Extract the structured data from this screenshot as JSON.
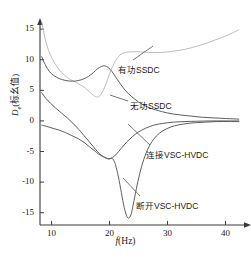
{
  "chart_data": {
    "type": "line",
    "title": "",
    "xlabel": "f(Hz)",
    "ylabel": "De(标幺值)",
    "ylabel_base": "D",
    "ylabel_sub": "e",
    "ylabel_unit": "(标幺值)",
    "xlim": [
      8,
      42.5
    ],
    "ylim": [
      -17.5,
      16.5
    ],
    "xticks": [
      10,
      20,
      30,
      40
    ],
    "yticks": [
      15,
      10,
      5,
      0,
      -5,
      -10,
      -15
    ],
    "grid": false,
    "legend_position": "inline-annotations",
    "series": [
      {
        "name": "有功SSDC",
        "color": "#b8b8b8",
        "points": [
          [
            8.3,
            16.2
          ],
          [
            8.7,
            14.2
          ],
          [
            9.2,
            12.3
          ],
          [
            9.8,
            10.8
          ],
          [
            10.5,
            9.5
          ],
          [
            11.3,
            8.4
          ],
          [
            12.2,
            7.5
          ],
          [
            13.2,
            6.8
          ],
          [
            14.2,
            6.3
          ],
          [
            15.0,
            5.9
          ],
          [
            15.8,
            5.4
          ],
          [
            16.5,
            4.8
          ],
          [
            17.2,
            4.2
          ],
          [
            17.8,
            3.9
          ],
          [
            18.4,
            4.2
          ],
          [
            19.0,
            5.2
          ],
          [
            19.6,
            6.6
          ],
          [
            20.2,
            8.2
          ],
          [
            20.9,
            9.6
          ],
          [
            21.6,
            10.6
          ],
          [
            22.4,
            11.1
          ],
          [
            23.5,
            11.3
          ],
          [
            25.0,
            11.3
          ],
          [
            27.0,
            11.2
          ],
          [
            29.0,
            11.2
          ],
          [
            31.0,
            11.4
          ],
          [
            33.0,
            11.7
          ],
          [
            35.0,
            12.2
          ],
          [
            37.0,
            12.8
          ],
          [
            39.0,
            13.5
          ],
          [
            41.0,
            14.3
          ],
          [
            42.3,
            14.9
          ]
        ]
      },
      {
        "name": "无功SSDC",
        "color": "#555555",
        "points": [
          [
            8.3,
            10.5
          ],
          [
            8.9,
            9.2
          ],
          [
            9.6,
            8.1
          ],
          [
            10.4,
            7.4
          ],
          [
            11.4,
            6.9
          ],
          [
            12.5,
            6.6
          ],
          [
            13.6,
            6.5
          ],
          [
            14.6,
            6.6
          ],
          [
            15.6,
            6.9
          ],
          [
            16.4,
            7.3
          ],
          [
            17.2,
            7.9
          ],
          [
            17.9,
            8.5
          ],
          [
            18.6,
            8.9
          ],
          [
            19.2,
            9.0
          ],
          [
            19.8,
            8.7
          ],
          [
            20.4,
            8.1
          ],
          [
            21.1,
            7.1
          ],
          [
            21.9,
            6.0
          ],
          [
            22.8,
            4.9
          ],
          [
            23.8,
            4.0
          ],
          [
            25.0,
            3.1
          ],
          [
            26.5,
            2.3
          ],
          [
            28.0,
            1.8
          ],
          [
            30.0,
            1.3
          ],
          [
            32.0,
            1.0
          ],
          [
            34.0,
            0.8
          ],
          [
            36.0,
            0.6
          ],
          [
            38.0,
            0.5
          ],
          [
            40.0,
            0.4
          ],
          [
            42.3,
            0.3
          ]
        ]
      },
      {
        "name": "断开VSC-HVDC",
        "color": "#555555",
        "points": [
          [
            8.3,
            4.6
          ],
          [
            9.0,
            3.7
          ],
          [
            9.8,
            2.9
          ],
          [
            10.7,
            2.1
          ],
          [
            11.7,
            1.3
          ],
          [
            12.7,
            0.5
          ],
          [
            13.7,
            -0.4
          ],
          [
            14.7,
            -1.4
          ],
          [
            15.6,
            -2.4
          ],
          [
            16.4,
            -3.3
          ],
          [
            17.2,
            -4.2
          ],
          [
            17.9,
            -5.0
          ],
          [
            18.6,
            -5.6
          ],
          [
            19.3,
            -6.0
          ],
          [
            19.9,
            -6.2
          ],
          [
            20.4,
            -6.1
          ],
          [
            20.9,
            -6.8
          ],
          [
            21.4,
            -8.6
          ],
          [
            21.9,
            -11.0
          ],
          [
            22.4,
            -13.6
          ],
          [
            22.9,
            -15.4
          ],
          [
            23.3,
            -15.9
          ],
          [
            23.7,
            -15.3
          ],
          [
            24.1,
            -13.6
          ],
          [
            24.6,
            -11.2
          ],
          [
            25.2,
            -8.6
          ],
          [
            25.9,
            -6.3
          ],
          [
            26.7,
            -4.4
          ],
          [
            27.6,
            -3.0
          ],
          [
            28.6,
            -2.0
          ],
          [
            29.8,
            -1.3
          ],
          [
            31.2,
            -0.8
          ],
          [
            32.8,
            -0.5
          ],
          [
            34.6,
            -0.3
          ],
          [
            36.5,
            -0.2
          ],
          [
            38.5,
            -0.1
          ],
          [
            40.5,
            -0.1
          ],
          [
            42.3,
            -0.1
          ]
        ]
      },
      {
        "name": "连接VSC-HVDC",
        "color": "#555555",
        "points": [
          [
            8.3,
            -0.7
          ],
          [
            9.2,
            -0.9
          ],
          [
            10.2,
            -1.2
          ],
          [
            11.3,
            -1.5
          ],
          [
            12.4,
            -1.9
          ],
          [
            13.5,
            -2.4
          ],
          [
            14.6,
            -2.9
          ],
          [
            15.6,
            -3.5
          ],
          [
            16.5,
            -4.2
          ],
          [
            17.3,
            -4.8
          ],
          [
            18.1,
            -5.4
          ],
          [
            18.8,
            -5.8
          ],
          [
            19.4,
            -6.1
          ],
          [
            19.9,
            -6.2
          ],
          [
            20.5,
            -6.0
          ],
          [
            21.2,
            -5.4
          ],
          [
            22.0,
            -4.5
          ],
          [
            22.9,
            -3.5
          ],
          [
            23.9,
            -2.6
          ],
          [
            25.0,
            -1.8
          ],
          [
            26.2,
            -1.2
          ],
          [
            27.6,
            -0.7
          ],
          [
            29.2,
            -0.4
          ],
          [
            31.0,
            -0.2
          ],
          [
            33.0,
            -0.1
          ],
          [
            35.0,
            -0.05
          ],
          [
            37.5,
            0.0
          ],
          [
            40.0,
            0.0
          ],
          [
            42.3,
            0.0
          ]
        ]
      }
    ],
    "annotations": [
      {
        "name": "有功SSDC",
        "text": "有功SSDC",
        "tx": 118,
        "ty": 63,
        "lx1": 133,
        "ly1": 60,
        "lx2": 153,
        "ly2": 46
      },
      {
        "name": "无功SSDC",
        "text": "无功SSDC",
        "tx": 130,
        "ty": 99,
        "lx1": 128,
        "ly1": 101,
        "lx2": 110,
        "ly2": 95
      },
      {
        "name": "连接VSC-HVDC",
        "text": "连接VSC-HVDC",
        "tx": 146,
        "ty": 148,
        "lx1": 150,
        "ly1": 145,
        "lx2": 128,
        "ly2": 124
      },
      {
        "name": "断开VSC-HVDC",
        "text": "断开VSC-HVDC",
        "tx": 136,
        "ty": 199,
        "lx1": 140,
        "ly1": 196,
        "lx2": 123,
        "ly2": 178
      }
    ]
  },
  "axis": {
    "xticklabels": [
      "10",
      "20",
      "30",
      "40"
    ],
    "yticklabels": [
      "15",
      "10",
      "5",
      "0",
      "-5",
      "-10",
      "-15"
    ],
    "xlabel": "f(Hz)",
    "xlabel_italic": "f",
    "xlabel_rest": "(Hz)"
  },
  "colors": {
    "axis": "#3a3a3a",
    "dark_series": "#555555",
    "light_series": "#b8b8b8",
    "text": "#1a1a1a"
  }
}
